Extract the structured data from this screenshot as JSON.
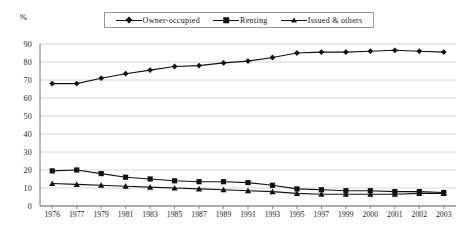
{
  "chart_data": {
    "type": "line",
    "title": "",
    "xlabel": "",
    "ylabel": "%",
    "ylim": [
      0,
      90
    ],
    "ytick_step": 10,
    "grid": true,
    "legend_position": "top-center",
    "categories": [
      "1976",
      "1977",
      "1979",
      "1981",
      "1983",
      "1985",
      "1987",
      "1989",
      "1991",
      "1993",
      "1995",
      "1997",
      "1999",
      "2000",
      "2001",
      "2002",
      "2003"
    ],
    "series": [
      {
        "name": "Owner-occupied",
        "marker": "diamond",
        "color": "#111111",
        "values": [
          68,
          68,
          71,
          73.5,
          75.5,
          77.5,
          78,
          79.5,
          80.5,
          82.5,
          85,
          85.5,
          85.5,
          86,
          86.5,
          86,
          85.5
        ]
      },
      {
        "name": "Renting",
        "marker": "square",
        "color": "#111111",
        "values": [
          19.5,
          20,
          18,
          16,
          15,
          14,
          13.5,
          13.5,
          13,
          11.5,
          9.5,
          9,
          8.5,
          8.5,
          8,
          8,
          7.5
        ]
      },
      {
        "name": "Issued & others",
        "marker": "triangle",
        "color": "#111111",
        "values": [
          12.5,
          12,
          11.5,
          11,
          10.5,
          10,
          9.5,
          9,
          8.5,
          8,
          7,
          6.5,
          6.5,
          6.5,
          6.5,
          7,
          7
        ]
      }
    ],
    "yticks": [
      "0",
      "10",
      "20",
      "30",
      "40",
      "50",
      "60",
      "70",
      "80",
      "90"
    ],
    "axis_unit": "%",
    "colors": {
      "gridline": "#c9c9c9",
      "axis": "#6e6e6e",
      "series": "#111111",
      "background": "#ffffff"
    }
  }
}
